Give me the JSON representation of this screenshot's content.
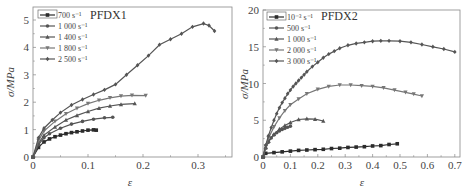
{
  "chart_data": [
    {
      "type": "line",
      "title": "PFDX1",
      "xlabel": "ε",
      "ylabel": "σ/MPa",
      "xlim": [
        0,
        0.36
      ],
      "ylim": [
        0,
        5.5
      ],
      "xticks": [
        "0",
        "0.1",
        "0.2",
        "0.3"
      ],
      "yticks": [
        "0",
        "1",
        "2",
        "3",
        "4",
        "5"
      ],
      "grid": false,
      "legend_position": "upper left",
      "series": [
        {
          "name": "700 s⁻¹",
          "marker": "square",
          "x": [
            0,
            0.01,
            0.02,
            0.03,
            0.04,
            0.05,
            0.06,
            0.07,
            0.08,
            0.09,
            0.1,
            0.11,
            0.115
          ],
          "y": [
            0,
            0.35,
            0.55,
            0.66,
            0.74,
            0.8,
            0.85,
            0.89,
            0.92,
            0.95,
            0.98,
            0.99,
            0.98
          ]
        },
        {
          "name": "1 000 s⁻¹",
          "marker": "circle",
          "x": [
            0,
            0.01,
            0.02,
            0.03,
            0.05,
            0.07,
            0.09,
            0.11,
            0.13,
            0.145
          ],
          "y": [
            0,
            0.45,
            0.7,
            0.85,
            1.05,
            1.2,
            1.3,
            1.38,
            1.43,
            1.45
          ]
        },
        {
          "name": "1 400 s⁻¹",
          "marker": "triangle-up",
          "x": [
            0,
            0.01,
            0.02,
            0.04,
            0.06,
            0.08,
            0.1,
            0.12,
            0.14,
            0.16,
            0.185
          ],
          "y": [
            0,
            0.5,
            0.8,
            1.1,
            1.35,
            1.52,
            1.66,
            1.78,
            1.86,
            1.92,
            1.95
          ]
        },
        {
          "name": "1 800 s⁻¹",
          "marker": "triangle-down",
          "x": [
            0,
            0.01,
            0.02,
            0.04,
            0.06,
            0.08,
            0.1,
            0.12,
            0.14,
            0.16,
            0.18,
            0.205
          ],
          "y": [
            0,
            0.6,
            0.95,
            1.3,
            1.58,
            1.78,
            1.95,
            2.07,
            2.16,
            2.22,
            2.25,
            2.24
          ]
        },
        {
          "name": "2 500 s⁻¹",
          "marker": "diamond",
          "x": [
            0,
            0.01,
            0.02,
            0.035,
            0.05,
            0.07,
            0.09,
            0.11,
            0.13,
            0.15,
            0.17,
            0.19,
            0.21,
            0.23,
            0.25,
            0.27,
            0.29,
            0.31,
            0.32,
            0.33
          ],
          "y": [
            0,
            0.7,
            1.05,
            1.35,
            1.62,
            1.9,
            2.1,
            2.28,
            2.45,
            2.65,
            3.0,
            3.35,
            3.7,
            4.1,
            4.3,
            4.5,
            4.75,
            4.87,
            4.8,
            4.6
          ]
        }
      ]
    },
    {
      "type": "line",
      "title": "PFDX2",
      "xlabel": "ε",
      "ylabel": "σ/MPa",
      "xlim": [
        0,
        0.72
      ],
      "ylim": [
        0,
        20
      ],
      "xticks": [
        "0",
        "0.1",
        "0.2",
        "0.3",
        "0.4",
        "0.5",
        "0.6",
        "0.7"
      ],
      "yticks": [
        "0",
        "5",
        "10",
        "15",
        "20"
      ],
      "grid": false,
      "legend_position": "upper left",
      "series": [
        {
          "name": "10⁻³ s⁻¹",
          "marker": "square",
          "x": [
            0,
            0.01,
            0.04,
            0.07,
            0.1,
            0.13,
            0.16,
            0.19,
            0.22,
            0.25,
            0.28,
            0.31,
            0.34,
            0.37,
            0.4,
            0.43,
            0.46,
            0.49
          ],
          "y": [
            0,
            0.5,
            0.6,
            0.7,
            0.8,
            0.9,
            0.95,
            1.0,
            1.05,
            1.15,
            1.2,
            1.3,
            1.35,
            1.4,
            1.5,
            1.55,
            1.7,
            1.8
          ]
        },
        {
          "name": "500 s⁻¹",
          "marker": "circle",
          "x": [
            0,
            0.01,
            0.02,
            0.03,
            0.04,
            0.05,
            0.06,
            0.07,
            0.08,
            0.09,
            0.1
          ],
          "y": [
            0,
            1.2,
            2.0,
            2.6,
            3.0,
            3.3,
            3.55,
            3.75,
            3.9,
            4.05,
            4.2
          ]
        },
        {
          "name": "1 000 s⁻¹",
          "marker": "triangle-up",
          "x": [
            0,
            0.01,
            0.02,
            0.04,
            0.06,
            0.08,
            0.1,
            0.13,
            0.16,
            0.19,
            0.22
          ],
          "y": [
            0,
            1.3,
            2.2,
            3.1,
            3.8,
            4.3,
            4.7,
            5.1,
            5.2,
            5.15,
            4.9
          ]
        },
        {
          "name": "2 000 s⁻¹",
          "marker": "triangle-down",
          "x": [
            0,
            0.01,
            0.02,
            0.04,
            0.06,
            0.08,
            0.1,
            0.13,
            0.16,
            0.2,
            0.24,
            0.28,
            0.32,
            0.36,
            0.4,
            0.44,
            0.48,
            0.52,
            0.55,
            0.58
          ],
          "y": [
            0,
            1.5,
            2.6,
            4.1,
            5.3,
            6.3,
            7.1,
            7.9,
            8.6,
            9.2,
            9.6,
            9.8,
            9.8,
            9.7,
            9.6,
            9.4,
            9.1,
            8.8,
            8.55,
            8.3
          ]
        },
        {
          "name": "3 000 s⁻¹",
          "marker": "diamond",
          "x": [
            0,
            0.01,
            0.02,
            0.03,
            0.04,
            0.05,
            0.06,
            0.07,
            0.08,
            0.09,
            0.1,
            0.11,
            0.12,
            0.13,
            0.14,
            0.15,
            0.16,
            0.18,
            0.2,
            0.22,
            0.24,
            0.26,
            0.28,
            0.31,
            0.34,
            0.37,
            0.4,
            0.43,
            0.46,
            0.5,
            0.54,
            0.58,
            0.62,
            0.66,
            0.7
          ],
          "y": [
            0,
            1.6,
            2.9,
            4.0,
            5.0,
            5.9,
            6.7,
            7.4,
            8.0,
            8.6,
            9.1,
            9.6,
            10.0,
            10.4,
            10.8,
            11.2,
            11.6,
            12.3,
            12.9,
            13.5,
            14.0,
            14.4,
            14.8,
            15.2,
            15.45,
            15.6,
            15.75,
            15.8,
            15.8,
            15.75,
            15.6,
            15.3,
            15.0,
            14.7,
            14.3
          ]
        }
      ]
    }
  ],
  "panels": [
    {
      "title": "PFDX1",
      "ylabel": "σ/MPa",
      "xlabel": "ε",
      "legend": [
        "700 s⁻¹",
        "1 000 s⁻¹",
        "1 400 s⁻¹",
        "1 800 s⁻¹",
        "2 500 s⁻¹"
      ]
    },
    {
      "title": "PFDX2",
      "ylabel": "σ/MPa",
      "xlabel": "ε",
      "legend": [
        "10⁻³ s⁻¹",
        "500 s⁻¹",
        "1 000 s⁻¹",
        "2 000 s⁻¹",
        "3 000 s⁻¹"
      ]
    }
  ],
  "colors": {
    "axis": "#888888",
    "series_dark": "#2b2b2b",
    "series_mid": "#555555",
    "series_light": "#777777"
  }
}
